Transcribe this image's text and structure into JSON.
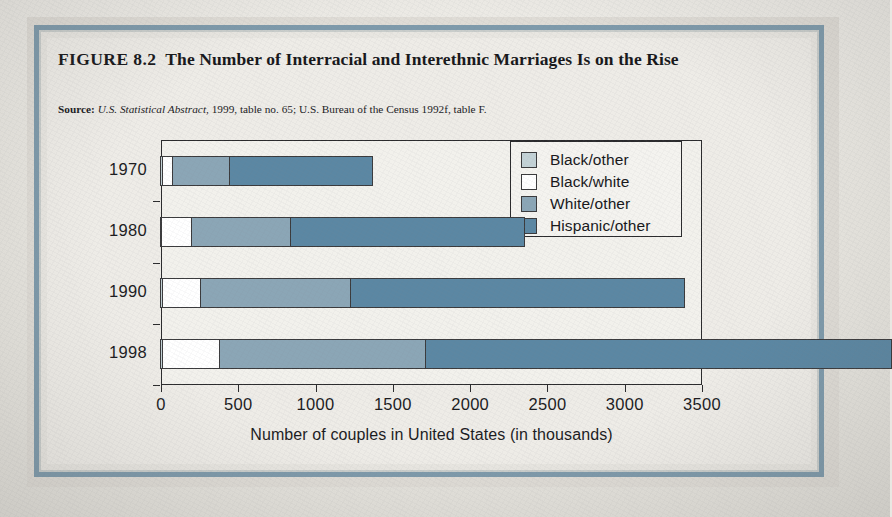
{
  "figure": {
    "number": "FIGURE 8.2",
    "title": "The Number of Interracial and Interethnic Marriages Is on the Rise",
    "title_line1": "The Number of Interracial and Interethnic Marriages",
    "title_line2": "Is on the Rise",
    "source_label": "Source:",
    "source_italic": "U.S. Statistical Abstract,",
    "source_rest": "1999, table no. 65; U.S. Bureau of the Census 1992f, table F."
  },
  "colors": {
    "black_other": "#c3d2d6",
    "black_white": "#ffffff",
    "white_other": "#8ba6b6",
    "hispanic_other": "#5b87a3",
    "frame_blue": "#7e9aab",
    "axis": "#2a2a2c",
    "paper": "#eeece7"
  },
  "chart_data": {
    "type": "bar",
    "orientation": "horizontal",
    "stacked": true,
    "title": "The Number of Interracial and Interethnic Marriages Is on the Rise",
    "xlabel": "Number of couples in United States (in thousands)",
    "ylabel": "",
    "categories": [
      "1970",
      "1980",
      "1990",
      "1998"
    ],
    "xticklabels": [
      "0",
      "500",
      "1000",
      "1500",
      "2000",
      "2500",
      "3000",
      "3500"
    ],
    "xticks": [
      0,
      500,
      1000,
      1500,
      2000,
      2500,
      3000,
      3500
    ],
    "xlim": [
      0,
      3500
    ],
    "grid": false,
    "legend_position": "upper right",
    "series": [
      {
        "name": "Black/other",
        "color": "#c3d2d6",
        "values": [
          12,
          10,
          15,
          17
        ]
      },
      {
        "name": "Black/white",
        "color": "#ffffff",
        "values": [
          65,
          195,
          246,
          364
        ]
      },
      {
        "name": "White/other",
        "color": "#8ba6b6",
        "values": [
          373,
          640,
          970,
          1336
        ]
      },
      {
        "name": "Hispanic/other",
        "color": "#5b87a3",
        "values": [
          922,
          1510,
          2156,
          3010
        ]
      }
    ],
    "cumulative_totals": [
      922,
      1510,
      2156,
      3010
    ]
  },
  "legend": {
    "items": [
      {
        "label": "Black/other",
        "color": "#c3d2d6"
      },
      {
        "label": "Black/white",
        "color": "#ffffff"
      },
      {
        "label": "White/other",
        "color": "#8ba6b6"
      },
      {
        "label": "Hispanic/other",
        "color": "#5b87a3"
      }
    ]
  }
}
